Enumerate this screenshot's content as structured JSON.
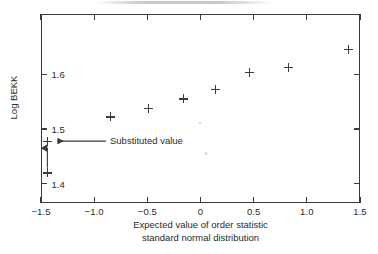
{
  "figure": {
    "background_color": "#ffffff",
    "ink_color": "#3a3a3a"
  },
  "chart_data": {
    "type": "scatter",
    "title": "",
    "xlabel": "Expected value of order statistic standard normal distribution",
    "xlabel_line1": "Expected value of order statistic",
    "xlabel_line2": "standard normal distribution",
    "ylabel": "Log BEKK",
    "xlim": [
      -1.5,
      1.5
    ],
    "ylim": [
      1.365,
      1.71
    ],
    "grid": false,
    "legend": false,
    "marker": "plus",
    "marker_color": "#3c3c3c",
    "xticks": [
      -1.5,
      -1.0,
      -0.5,
      0,
      0.5,
      1.0,
      1.5
    ],
    "xticklabels": [
      "−1.5",
      "−1.0",
      "−0.5",
      "0",
      "0.5",
      "1.0",
      "1.5"
    ],
    "yticks": [
      1.4,
      1.5,
      1.6
    ],
    "yticklabels": [
      "1.4",
      "1.5",
      "1.6"
    ],
    "x": [
      -1.44,
      -1.44,
      -0.85,
      -0.49,
      -0.16,
      0.14,
      0.46,
      0.83,
      1.39
    ],
    "y": [
      1.42,
      1.478,
      1.522,
      1.538,
      1.555,
      1.572,
      1.603,
      1.612,
      1.645
    ],
    "points": [
      {
        "x": -1.44,
        "y": 1.42,
        "label": "original value"
      },
      {
        "x": -1.44,
        "y": 1.478,
        "label": "substituted value"
      },
      {
        "x": -0.85,
        "y": 1.522,
        "label": ""
      },
      {
        "x": -0.49,
        "y": 1.538,
        "label": ""
      },
      {
        "x": -0.16,
        "y": 1.555,
        "label": ""
      },
      {
        "x": 0.14,
        "y": 1.572,
        "label": ""
      },
      {
        "x": 0.46,
        "y": 1.603,
        "label": ""
      },
      {
        "x": 0.83,
        "y": 1.612,
        "label": ""
      },
      {
        "x": 1.39,
        "y": 1.645,
        "label": ""
      }
    ],
    "annotations": [
      {
        "text": "Substituted value",
        "type": "leader-arrow-left",
        "target_x": -1.44,
        "target_y": 1.478
      },
      {
        "text": "",
        "type": "vertical-arrow-up",
        "from_x": -1.44,
        "from_y": 1.42,
        "to_x": -1.44,
        "to_y": 1.468
      }
    ]
  }
}
